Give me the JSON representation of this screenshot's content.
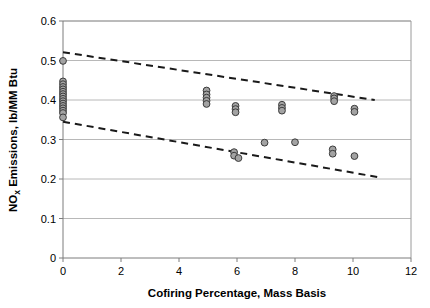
{
  "chart_data": {
    "type": "scatter",
    "title": "",
    "xlabel": "Cofiring Percentage, Mass Basis",
    "ylabel_main": "NO",
    "ylabel_sub": "x",
    "ylabel_rest": " Emissions, lb/MM Btu",
    "ylabel_full": "NOx Emissions, lb/MM Btu",
    "xlim": [
      0,
      12
    ],
    "ylim": [
      0,
      0.6
    ],
    "xticks": [
      0,
      2,
      4,
      6,
      8,
      10,
      12
    ],
    "xtick_labels": [
      "0",
      "2",
      "4",
      "6",
      "8",
      "10",
      "12"
    ],
    "yticks": [
      0,
      0.1,
      0.2,
      0.3,
      0.4,
      0.5,
      0.6
    ],
    "ytick_labels": [
      "0",
      "0.1",
      "0.2",
      "0.3",
      "0.4",
      "0.5",
      "0.6"
    ],
    "grid": "horizontal",
    "legend": "none",
    "marker": {
      "shape": "circle",
      "fill_color": "#a3a3a3",
      "edge_color": "#3b3b3b",
      "radius_px": 3.4
    },
    "series": [
      {
        "name": "NOx emissions data",
        "points": [
          [
            0,
            0.499
          ],
          [
            0,
            0.447
          ],
          [
            0,
            0.44
          ],
          [
            0,
            0.433
          ],
          [
            0,
            0.427
          ],
          [
            0,
            0.421
          ],
          [
            0,
            0.415
          ],
          [
            0,
            0.409
          ],
          [
            0,
            0.403
          ],
          [
            0,
            0.397
          ],
          [
            0,
            0.391
          ],
          [
            0,
            0.385
          ],
          [
            0,
            0.379
          ],
          [
            0,
            0.373
          ],
          [
            0,
            0.367
          ],
          [
            0,
            0.356
          ],
          [
            4.95,
            0.424
          ],
          [
            4.95,
            0.414
          ],
          [
            4.95,
            0.406
          ],
          [
            4.95,
            0.398
          ],
          [
            4.95,
            0.39
          ],
          [
            5.95,
            0.385
          ],
          [
            5.95,
            0.377
          ],
          [
            5.95,
            0.369
          ],
          [
            5.9,
            0.268
          ],
          [
            5.9,
            0.259
          ],
          [
            6.05,
            0.253
          ],
          [
            6.95,
            0.292
          ],
          [
            7.55,
            0.388
          ],
          [
            7.55,
            0.38
          ],
          [
            7.55,
            0.373
          ],
          [
            8.0,
            0.293
          ],
          [
            9.35,
            0.41
          ],
          [
            9.35,
            0.404
          ],
          [
            9.35,
            0.397
          ],
          [
            9.3,
            0.275
          ],
          [
            9.3,
            0.264
          ],
          [
            10.05,
            0.378
          ],
          [
            10.05,
            0.37
          ],
          [
            10.05,
            0.258
          ]
        ]
      }
    ],
    "trendlines": [
      {
        "name": "upper-bound-trendline",
        "style": "dashed",
        "color": "#1a1a1a",
        "x_start": 0,
        "y_start": 0.521,
        "x_end": 10.75,
        "y_end": 0.4
      },
      {
        "name": "lower-bound-trendline",
        "style": "dashed",
        "color": "#1a1a1a",
        "x_start": 0,
        "y_start": 0.345,
        "x_end": 10.85,
        "y_end": 0.205
      }
    ]
  }
}
